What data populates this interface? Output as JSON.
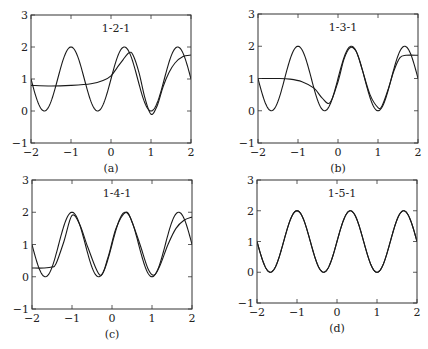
{
  "chart_data": [
    {
      "type": "line",
      "panel": "a",
      "caption": "(a)",
      "annotation": "1-2-1",
      "xlim": [
        -2,
        2
      ],
      "ylim": [
        -1,
        3
      ],
      "xticks": [
        "−2",
        "−1",
        "0",
        "1",
        "2"
      ],
      "yticks": [
        "−1",
        "0",
        "1",
        "2",
        "3"
      ],
      "box": {
        "left": 31,
        "top": 15,
        "right": 191,
        "bottom": 143
      },
      "series": [
        {
          "name": "target",
          "fn": "target"
        },
        {
          "name": "network approximation",
          "points": [
            [
              -2,
              0.8
            ],
            [
              -1.5,
              0.78
            ],
            [
              -1,
              0.8
            ],
            [
              -0.5,
              0.85
            ],
            [
              -0.2,
              0.95
            ],
            [
              0,
              1.1
            ],
            [
              0.15,
              1.35
            ],
            [
              0.3,
              1.6
            ],
            [
              0.45,
              1.82
            ],
            [
              0.55,
              1.75
            ],
            [
              0.7,
              1.2
            ],
            [
              0.85,
              0.4
            ],
            [
              1.0,
              -0.1
            ],
            [
              1.15,
              0.15
            ],
            [
              1.3,
              0.75
            ],
            [
              1.45,
              1.2
            ],
            [
              1.6,
              1.5
            ],
            [
              1.8,
              1.7
            ],
            [
              2,
              1.75
            ]
          ]
        }
      ]
    },
    {
      "type": "line",
      "panel": "b",
      "caption": "(b)",
      "annotation": "1-3-1",
      "xlim": [
        -2,
        2
      ],
      "ylim": [
        -1,
        3
      ],
      "xticks": [
        "−2",
        "−1",
        "0",
        "1",
        "2"
      ],
      "yticks": [
        "−1",
        "0",
        "1",
        "2",
        "3"
      ],
      "box": {
        "left": 258,
        "top": 14,
        "right": 418,
        "bottom": 143
      },
      "series": [
        {
          "name": "target",
          "fn": "target"
        },
        {
          "name": "network approximation",
          "points": [
            [
              -2,
              1.0
            ],
            [
              -1.5,
              1.0
            ],
            [
              -1.2,
              0.98
            ],
            [
              -0.9,
              0.9
            ],
            [
              -0.6,
              0.7
            ],
            [
              -0.4,
              0.4
            ],
            [
              -0.2,
              0.25
            ],
            [
              0,
              0.9
            ],
            [
              0.15,
              1.6
            ],
            [
              0.3,
              1.95
            ],
            [
              0.45,
              1.85
            ],
            [
              0.6,
              1.3
            ],
            [
              0.8,
              0.5
            ],
            [
              1.0,
              0.1
            ],
            [
              1.1,
              0.15
            ],
            [
              1.25,
              0.65
            ],
            [
              1.4,
              1.25
            ],
            [
              1.55,
              1.65
            ],
            [
              1.7,
              1.72
            ],
            [
              2,
              1.72
            ]
          ]
        }
      ]
    },
    {
      "type": "line",
      "panel": "c",
      "caption": "(c)",
      "annotation": "1-4-1",
      "xlim": [
        -2,
        2
      ],
      "ylim": [
        -1,
        3
      ],
      "xticks": [
        "−2",
        "−1",
        "0",
        "1",
        "2"
      ],
      "yticks": [
        "−1",
        "0",
        "1",
        "2",
        "3"
      ],
      "box": {
        "left": 32,
        "top": 180,
        "right": 192,
        "bottom": 309
      },
      "series": [
        {
          "name": "target",
          "fn": "target"
        },
        {
          "name": "network approximation",
          "points": [
            [
              -2,
              0.27
            ],
            [
              -1.7,
              0.27
            ],
            [
              -1.5,
              0.3
            ],
            [
              -1.4,
              0.4
            ],
            [
              -1.2,
              1.1
            ],
            [
              -1.0,
              1.9
            ],
            [
              -0.8,
              1.6
            ],
            [
              -0.6,
              0.9
            ],
            [
              -0.3,
              0.05
            ],
            [
              -0.1,
              0.6
            ],
            [
              0.1,
              1.5
            ],
            [
              0.35,
              2.0
            ],
            [
              0.5,
              1.7
            ],
            [
              0.7,
              1.0
            ],
            [
              0.9,
              0.25
            ],
            [
              1.05,
              0.05
            ],
            [
              1.2,
              0.35
            ],
            [
              1.4,
              1.0
            ],
            [
              1.6,
              1.5
            ],
            [
              1.8,
              1.75
            ],
            [
              2,
              1.85
            ]
          ]
        }
      ]
    },
    {
      "type": "line",
      "panel": "d",
      "caption": "(d)",
      "annotation": "1-5-1",
      "xlim": [
        -2,
        2
      ],
      "ylim": [
        -1,
        3
      ],
      "xticks": [
        "−2",
        "−1",
        "0",
        "1",
        "2"
      ],
      "yticks": [
        "−1",
        "0",
        "1",
        "2",
        "3"
      ],
      "box": {
        "left": 257,
        "top": 180,
        "right": 417,
        "bottom": 303
      },
      "series": [
        {
          "name": "target",
          "fn": "target"
        },
        {
          "name": "network approximation",
          "fn": "target"
        }
      ]
    }
  ],
  "target_function": "y = 1 + sin(3πx/2)"
}
